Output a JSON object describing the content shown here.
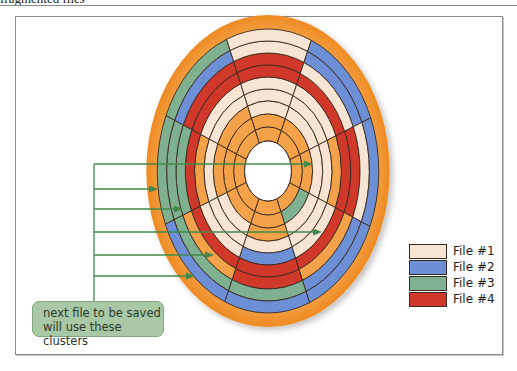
{
  "header": {
    "title": "fragmented files"
  },
  "legend": {
    "items": [
      {
        "label": "File #1",
        "color": "#f7e4d2"
      },
      {
        "label": "File #2",
        "color": "#6d8fd6"
      },
      {
        "label": "File #3",
        "color": "#7fb08f"
      },
      {
        "label": "File #4",
        "color": "#d0382a"
      }
    ]
  },
  "callout": {
    "line1": "next file to be saved",
    "line2": "will use these clusters",
    "color": "#a9c8a6",
    "arrow_color": "#3f8a4a"
  },
  "colors": {
    "free": "#f4a24a",
    "platter": "#f39a3c",
    "outline": "#3a2a20"
  },
  "disk": {
    "cx": 268,
    "cy": 171,
    "rx_scale": 0.78,
    "rings": [
      {
        "r0": 30,
        "r1": 44
      },
      {
        "r0": 44,
        "r1": 57
      },
      {
        "r0": 57,
        "r1": 70
      },
      {
        "r0": 70,
        "r1": 82
      },
      {
        "r0": 82,
        "r1": 94
      },
      {
        "r0": 94,
        "r1": 106
      },
      {
        "r0": 106,
        "r1": 118
      },
      {
        "r0": 118,
        "r1": 130
      },
      {
        "r0": 130,
        "r1": 142
      }
    ],
    "sectors": 8,
    "start_angle": -112,
    "cells": [
      [
        "F",
        "F",
        "F",
        "F",
        "F",
        "F",
        "F",
        "F"
      ],
      [
        "F",
        "F",
        "F",
        "3",
        "F",
        "F",
        "F",
        "F"
      ],
      [
        "1",
        "1",
        "1",
        "1",
        "F",
        "1",
        "F",
        "F"
      ],
      [
        "1",
        "1",
        "1",
        "1",
        "1",
        "1",
        "1",
        "1"
      ],
      [
        "1",
        "1",
        "F",
        "1",
        "2",
        "1",
        "F",
        "1"
      ],
      [
        "4",
        "4",
        "4",
        "4",
        "4",
        "4",
        "4",
        "4"
      ],
      [
        "4",
        "1",
        "4",
        "F",
        "4",
        "F",
        "3",
        "4"
      ],
      [
        "1",
        "2",
        "1",
        "2",
        "3",
        "3",
        "3",
        "2"
      ],
      [
        "1",
        "2",
        "2",
        "2",
        "2",
        "2",
        "3",
        "3"
      ]
    ]
  },
  "arrows": [
    {
      "y": 164,
      "x_end": 313
    },
    {
      "y": 189,
      "x_end": 158
    },
    {
      "y": 209,
      "x_end": 183
    },
    {
      "y": 232,
      "x_end": 322
    },
    {
      "y": 255,
      "x_end": 214
    },
    {
      "y": 276,
      "x_end": 195
    }
  ]
}
